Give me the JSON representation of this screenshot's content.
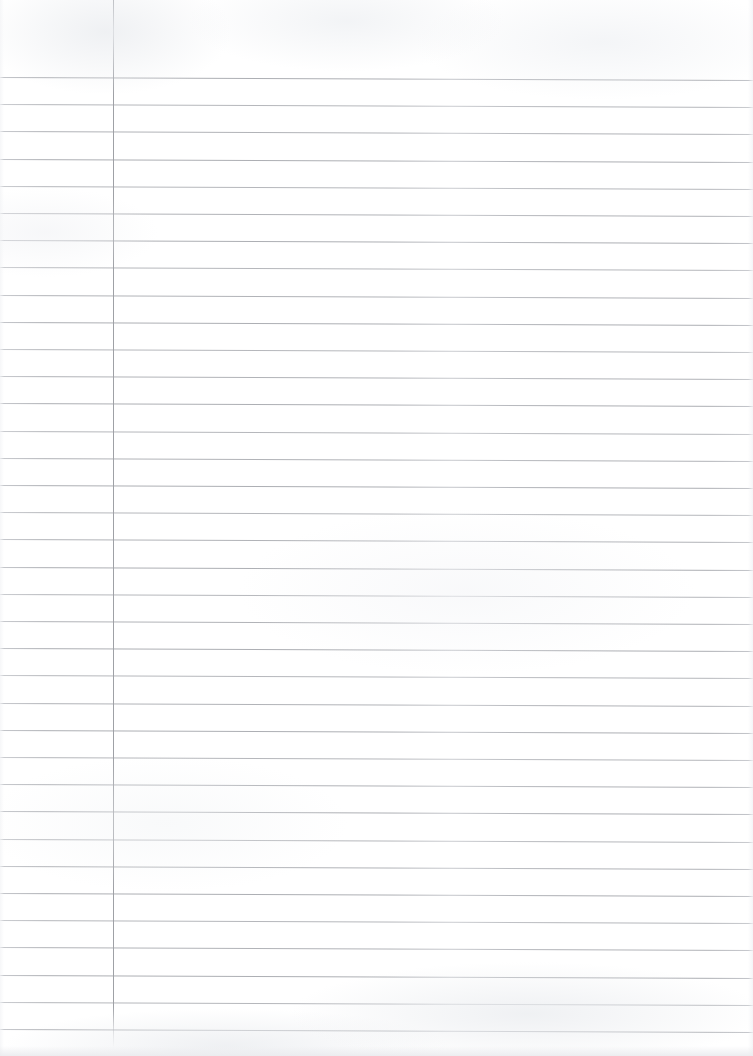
{
  "page": {
    "kind": "scanned-lined-notebook-page",
    "width": 753,
    "height": 1056,
    "background_color": "#ffffff",
    "text_content": "",
    "has_handwriting": false,
    "has_printed_text": false
  },
  "ruling": {
    "line_color": "#a9abb0",
    "line_color_faint": "#c2c4c9",
    "line_thickness_px": 1,
    "line_spacing_px": 27.2,
    "first_line_y": 77,
    "line_count": 36,
    "skew_degrees": 0.23,
    "line_left_x": 0,
    "line_right_x": 753,
    "line_y_positions": [
      77,
      104.2,
      131.4,
      158.6,
      185.8,
      213,
      240.2,
      267.4,
      294.6,
      321.8,
      349,
      376.2,
      403.4,
      430.6,
      457.8,
      485,
      512.2,
      539.4,
      566.6,
      593.8,
      621,
      648.2,
      675.4,
      702.6,
      729.8,
      757,
      784.2,
      811.4,
      838.6,
      865.8,
      893,
      920.2,
      947.4,
      974.6,
      1001.8,
      1029
    ]
  },
  "margin_rule": {
    "name": "vertical-margin-line",
    "color": "#9fa1a6",
    "x": 113,
    "top_y": 0,
    "bottom_y": 1048,
    "thickness_px": 1
  },
  "regions": {
    "margin_label": "left margin column",
    "writing_label": "main writing area"
  }
}
